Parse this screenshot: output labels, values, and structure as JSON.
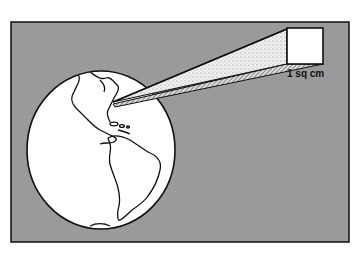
{
  "figure": {
    "label": "1 sq cm",
    "colors": {
      "background": "#9a9a9a",
      "frame": "#111111",
      "globe": "#ffffff",
      "beam": "#e6e6e6",
      "square": "#ffffff"
    }
  }
}
